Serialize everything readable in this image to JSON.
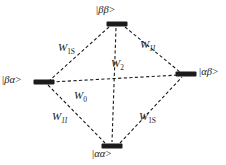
{
  "diagram": {
    "type": "energy-level-transition-diagram",
    "background_color": "#ffffff",
    "line_color": "#1b1b1b",
    "node_color": "#1b1b1b",
    "line_style": "dashed",
    "states": [
      {
        "id": "beta-beta",
        "label": "|ββ>",
        "label_position": "above",
        "node": {
          "cx": 117,
          "cy": 24,
          "w": 20,
          "h": 4
        },
        "text": {
          "x": 96,
          "y": 4
        }
      },
      {
        "id": "beta-alpha",
        "label": "|βα>",
        "label_position": "left",
        "node": {
          "cx": 44,
          "cy": 82,
          "w": 20,
          "h": 4
        },
        "text": {
          "x": 2,
          "y": 74
        }
      },
      {
        "id": "alpha-beta",
        "label": "|αβ>",
        "label_position": "right",
        "node": {
          "cx": 186,
          "cy": 74,
          "w": 20,
          "h": 4
        },
        "text": {
          "x": 199,
          "y": 66
        }
      },
      {
        "id": "alpha-alpha",
        "label": "|αα>",
        "label_position": "below",
        "node": {
          "cx": 112,
          "cy": 146,
          "w": 20,
          "h": 4
        },
        "text": {
          "x": 92,
          "y": 148
        }
      }
    ],
    "transitions": [
      {
        "id": "w1s-upper-left",
        "label_main": "W",
        "label_sub": "1S",
        "sub_style": "smallcaps",
        "from": "beta-alpha",
        "to": "beta-beta",
        "text": {
          "x": 58,
          "y": 41
        }
      },
      {
        "id": "w1i-upper-right",
        "label_main": "W",
        "label_sub": "1I",
        "sub_style": "italic",
        "from": "beta-beta",
        "to": "alpha-beta",
        "text": {
          "x": 140,
          "y": 38
        }
      },
      {
        "id": "w2-center",
        "label_main": "W",
        "label_sub": "2",
        "sub_style": "normal",
        "from": "beta-beta",
        "to": "alpha-alpha",
        "text": {
          "x": 111,
          "y": 57
        }
      },
      {
        "id": "w0-center",
        "label_main": "W",
        "label_sub": "0",
        "sub_style": "normal",
        "from": "beta-alpha",
        "to": "alpha-beta",
        "text": {
          "x": 74,
          "y": 89
        }
      },
      {
        "id": "w1i-lower-left",
        "label_main": "W",
        "label_sub": "1I",
        "sub_style": "italic",
        "from": "beta-alpha",
        "to": "alpha-alpha",
        "text": {
          "x": 52,
          "y": 110
        }
      },
      {
        "id": "w1s-lower-right",
        "label_main": "W",
        "label_sub": "1S",
        "sub_style": "smallcaps",
        "from": "alpha-alpha",
        "to": "alpha-beta",
        "text": {
          "x": 139,
          "y": 110
        }
      }
    ],
    "edges": [
      {
        "id": "edge-bb-ba",
        "x1": 109,
        "y1": 27,
        "x2": 50,
        "y2": 80
      },
      {
        "id": "edge-bb-ab",
        "x1": 125,
        "y1": 27,
        "x2": 180,
        "y2": 72
      },
      {
        "id": "edge-ba-aa",
        "x1": 48,
        "y1": 85,
        "x2": 105,
        "y2": 143
      },
      {
        "id": "edge-aa-ab",
        "x1": 120,
        "y1": 143,
        "x2": 182,
        "y2": 77
      },
      {
        "id": "edge-bb-aa",
        "x1": 116,
        "y1": 28,
        "x2": 112,
        "y2": 142
      },
      {
        "id": "edge-ba-ab",
        "x1": 51,
        "y1": 82,
        "x2": 179,
        "y2": 75
      }
    ]
  }
}
